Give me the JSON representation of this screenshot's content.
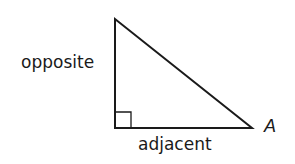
{
  "diagram": {
    "type": "right-triangle",
    "labels": {
      "opposite": "opposite",
      "adjacent": "adjacent",
      "angle": "A"
    },
    "vertices": {
      "top": [
        115,
        19
      ],
      "right_angle": [
        115,
        128
      ],
      "angle_A": [
        252,
        128
      ]
    },
    "right_angle_marker_size": 15,
    "stroke_color": "#1a1a1a"
  }
}
